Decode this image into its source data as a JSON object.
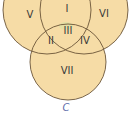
{
  "diagram": {
    "type": "venn-3-set",
    "colors": {
      "fill": "#f6dca6",
      "stroke": "#6b5538",
      "center_tint": "#d9dca0",
      "label": "#3a3a3a",
      "set_label": "#5a6aa8"
    },
    "circles": [
      {
        "name": "A",
        "cx": 47,
        "cy": 10,
        "r": 44
      },
      {
        "name": "B",
        "cx": 84,
        "cy": 10,
        "r": 44
      },
      {
        "name": "C",
        "cx": 68,
        "cy": 62,
        "r": 38
      }
    ],
    "regions": [
      {
        "id": "V",
        "label": "V",
        "x": 30,
        "y": 15
      },
      {
        "id": "I",
        "label": "I",
        "x": 67,
        "y": 10
      },
      {
        "id": "VI",
        "label": "VI",
        "x": 104,
        "y": 15
      },
      {
        "id": "II",
        "label": "II",
        "x": 51,
        "y": 42
      },
      {
        "id": "III",
        "label": "III",
        "x": 68,
        "y": 32
      },
      {
        "id": "IV",
        "label": "IV",
        "x": 84,
        "y": 42
      },
      {
        "id": "VII",
        "label": "VII",
        "x": 67,
        "y": 72
      }
    ],
    "set_labels": [
      {
        "name": "C",
        "label": "C",
        "x": 66,
        "y": 108
      }
    ]
  }
}
